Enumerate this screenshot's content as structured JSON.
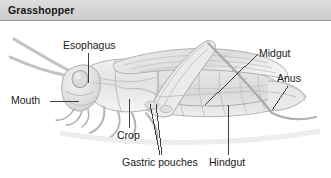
{
  "figure": {
    "title": "Grasshopper",
    "width": 331,
    "height": 178
  },
  "header": {
    "title": "Grasshopper",
    "background_color": "#d6d6d6",
    "rule_color": "#8f8f8f",
    "text_color": "#161616"
  },
  "illustration": {
    "name": "grasshopper-pencil-drawing",
    "style": "graphite-pencil-sketch",
    "ink_color": "#9a9a9a",
    "shade_color": "#cfcfcf",
    "background_color": "#ffffff"
  },
  "labels": [
    {
      "id": "esophagus",
      "text": "Esophagus",
      "x": 63,
      "y": 39
    },
    {
      "id": "mouth",
      "text": "Mouth",
      "x": 11,
      "y": 94
    },
    {
      "id": "crop",
      "text": "Crop",
      "x": 117,
      "y": 129
    },
    {
      "id": "gastric-pouches",
      "text": "Gastric pouches",
      "x": 122,
      "y": 156
    },
    {
      "id": "hindgut",
      "text": "Hindgut",
      "x": 209,
      "y": 156
    },
    {
      "id": "midgut",
      "text": "Midgut",
      "x": 259,
      "y": 47
    },
    {
      "id": "anus",
      "text": "Anus",
      "x": 277,
      "y": 72
    }
  ],
  "leader_lines": {
    "color": "#2b2b2b",
    "width": 0.9,
    "count": 8
  }
}
